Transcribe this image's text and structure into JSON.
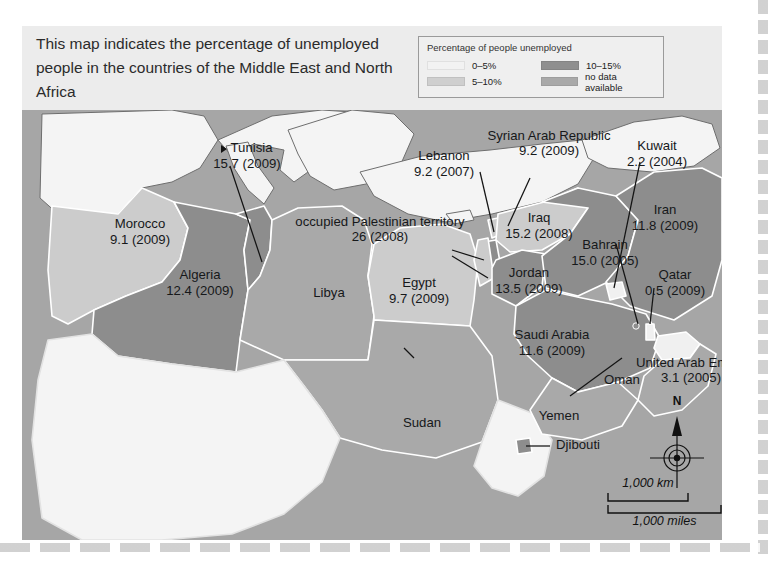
{
  "caption": "This map indicates the percentage of unemployed people in the countries of the Middle East and North Africa",
  "legend": {
    "title": "Percentage of people unemployed",
    "items": [
      {
        "label": "0–5%",
        "color": "#f2f2f2"
      },
      {
        "label": "10–15%",
        "color": "#8f8f8f"
      },
      {
        "label": "5–10%",
        "color": "#cfcfcf"
      },
      {
        "label": "no data available",
        "color": "#a9a9a9"
      }
    ]
  },
  "map": {
    "scale": {
      "km": "1,000 km",
      "miles": "1,000 miles"
    },
    "compass": {
      "north": "N"
    },
    "colors": {
      "ocean": "#a6a6a6",
      "out_of_scope": "#f4f4f4",
      "band_0_5": "#f0f0f0",
      "band_5_10": "#cccccc",
      "band_10_15": "#8d8d8d",
      "no_data": "#a9a9a9",
      "border": "#ffffff",
      "coast": "#6e6e6e"
    },
    "labels": [
      {
        "name": "Morocco",
        "value": "9.1 (2009)"
      },
      {
        "name": "Algeria",
        "value": "12.4 (2009)"
      },
      {
        "name": "Tunisia",
        "value": "15.7 (2009)"
      },
      {
        "name": "Libya",
        "value": ""
      },
      {
        "name": "Egypt",
        "value": "9.7 (2009)"
      },
      {
        "name": "Sudan",
        "value": ""
      },
      {
        "name": "Lebanon",
        "value": "9.2 (2007)"
      },
      {
        "name": "occupied Palestinian territory",
        "value": "26 (2008)"
      },
      {
        "name": "Syrian Arab Republic",
        "value": "9.2 (2009)"
      },
      {
        "name": "Iraq",
        "value": "15.2 (2008)"
      },
      {
        "name": "Jordan",
        "value": "13.5 (2009)"
      },
      {
        "name": "Kuwait",
        "value": "2.2 (2004)"
      },
      {
        "name": "Iran",
        "value": "11.8 (2009)"
      },
      {
        "name": "Bahrain",
        "value": "15.0 (2005)"
      },
      {
        "name": "Qatar",
        "value": "0.5 (2009)"
      },
      {
        "name": "Saudi Arabia",
        "value": "11.6 (2009)"
      },
      {
        "name": "United Arab Emirates",
        "value": "3.1 (2005)"
      },
      {
        "name": "Oman",
        "value": ""
      },
      {
        "name": "Yemen",
        "value": ""
      },
      {
        "name": "Djibouti",
        "value": ""
      }
    ]
  }
}
